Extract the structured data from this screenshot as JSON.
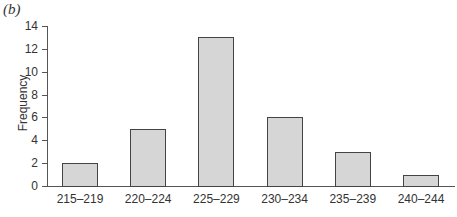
{
  "panel_label": "(b)",
  "chart_data": {
    "type": "bar",
    "title": "",
    "xlabel": "",
    "ylabel": "Frequency",
    "categories": [
      "215–219",
      "220–224",
      "225–229",
      "230–234",
      "235–239",
      "240–244"
    ],
    "values": [
      2,
      5,
      13,
      6,
      3,
      1
    ],
    "ylim": [
      0,
      14
    ],
    "yticks": [
      0,
      2,
      4,
      6,
      8,
      10,
      12,
      14
    ],
    "grid": false,
    "legend": null,
    "colors": {
      "bar_fill": "#d6d6d6",
      "bar_edge": "#444444",
      "axis": "#555555"
    }
  }
}
